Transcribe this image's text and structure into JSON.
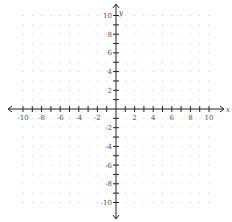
{
  "chart_data": {
    "type": "scatter",
    "title": "",
    "xlabel": "x",
    "ylabel": "y",
    "xlim": [
      -10,
      10
    ],
    "ylim": [
      -10,
      10
    ],
    "grid": "dots",
    "x_ticks": [
      -10,
      -9,
      -8,
      -7,
      -6,
      -5,
      -4,
      -3,
      -2,
      -1,
      1,
      2,
      3,
      4,
      5,
      6,
      7,
      8,
      9,
      10
    ],
    "y_ticks": [
      -10,
      -9,
      -8,
      -7,
      -6,
      -5,
      -4,
      -3,
      -2,
      -1,
      1,
      2,
      3,
      4,
      5,
      6,
      7,
      8,
      9,
      10
    ],
    "x_tick_labels": [
      "-10",
      "-8",
      "-6",
      "-4",
      "-2",
      "2",
      "4",
      "6",
      "8",
      "10"
    ],
    "y_tick_labels": [
      "10",
      "8",
      "6",
      "4",
      "2",
      "-2",
      "-4",
      "-6",
      "-8",
      "-10"
    ],
    "series": [],
    "legend": null
  },
  "layout": {
    "origin_px": [
      116,
      109
    ],
    "unit_px_x": 9.3,
    "unit_px_y": 9.35,
    "x_axis_px": [
      8,
      224
    ],
    "y_axis_px": [
      4,
      219
    ],
    "axis_color": "#222222",
    "grid_dot_color": "#c8c8c8",
    "label_color": "#555555"
  }
}
